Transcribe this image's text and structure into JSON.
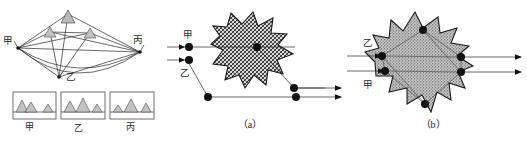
{
  "figure": {
    "panels": [
      {
        "id": "panel-left",
        "caption": "",
        "station_labels": [
          "甲",
          "乙",
          "丙"
        ],
        "profile_boxes": [
          {
            "label": "甲"
          },
          {
            "label": "乙"
          },
          {
            "label": "丙"
          }
        ]
      },
      {
        "id": "panel-a",
        "caption": "（a）",
        "entry_labels": [
          "甲",
          "乙"
        ]
      },
      {
        "id": "panel-b",
        "caption": "（b）",
        "entry_labels": [
          "乙",
          "甲"
        ]
      }
    ]
  },
  "panel_left": {
    "label_jia": "甲",
    "label_yi": "乙",
    "label_bing": "丙",
    "box1_label": "甲",
    "box2_label": "乙",
    "box3_label": "丙"
  },
  "panel_a": {
    "label_jia": "甲",
    "label_yi": "乙",
    "caption": "（a）"
  },
  "panel_b": {
    "label_yi": "乙",
    "label_jia": "甲",
    "caption": "（b）"
  },
  "colors": {
    "line": "#2a2a2a",
    "node": "#111111",
    "peak_fill": "#b9b9b9",
    "blob_outline": "#1a1a1a",
    "background": "#ffffff",
    "text": "#1e1e1e"
  }
}
